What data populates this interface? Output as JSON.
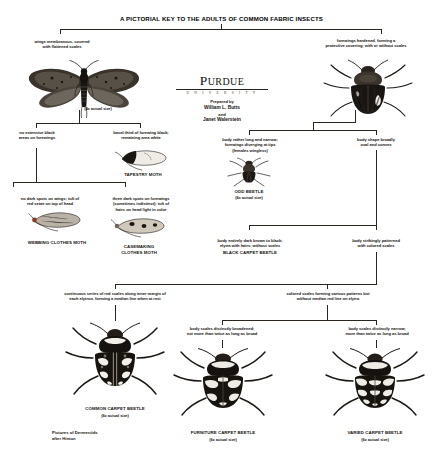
{
  "title": "A PICTORIAL KEY TO THE ADULTS OF COMMON FABRIC INSECTS",
  "publisher": {
    "name_main": "URDUE",
    "name_initial": "P",
    "subtitle": "U N I V E R S I T Y",
    "prepared_by_label": "Prepared by",
    "author_1": "William L. Butts",
    "conjunction": "and",
    "author_2": "Janet Walerstein"
  },
  "credit_note": "Pictures of Dermestids\nafter Hinton",
  "couplets": {
    "tier1_left": "wings membranous, covered\nwith flattened scales",
    "tier1_right": "forewings hardened, forming a\nprotective covering; with or without scales",
    "tier2_moth_left": "no extensive black\nareas on forewings",
    "tier2_moth_right": "basal third of forewing black;\nremaining area white",
    "tier2_beetle_left": "body rather long and narrow;\nforewings diverging at tips\n(females wingless)",
    "tier2_beetle_right": "body shape broadly\noval and convex",
    "tier3_moth_left": "no dark spots on wings; tuft of\nred setae on top of head",
    "tier3_moth_right": "three dark spots on forewings\n(sometimes indistinct); tuft of\nhairs on head light in color",
    "tier3_beetle_left": "body entirely dark brown to black;\nelytra with hairs; without scales",
    "tier3_beetle_right": "body strikingly patterned\nwith colored scales",
    "tier4_left": "continuous series of red scales along inner margin of\neach elytron, forming a median line when at rest",
    "tier4_right": "colored scales forming various patterns but\nwithout median red line on elytra",
    "tier5_left": "body scales distinctly broadened;\nnot more than twice as long as broad",
    "tier5_right": "body scales distinctly narrow;\nmore than twice as long as broad"
  },
  "species": {
    "clothes_moth_scale": "(4x actual size)",
    "tapestry_moth": "TAPESTRY MOTH",
    "webbing_clothes_moth": "WEBBING CLOTHES MOTH",
    "casemaking_clothes_moth": "CASEMAKING\nCLOTHES MOTH",
    "odd_beetle": "ODD BEETLE",
    "odd_beetle_scale": "(6x actual size)",
    "black_carpet_beetle": "BLACK CARPET BEETLE",
    "common_carpet_beetle": "COMMON CARPET BEETLE",
    "common_carpet_beetle_scale": "(6x actual size)",
    "furniture_carpet_beetle": "FURNITURE CARPET BEETLE",
    "furniture_carpet_beetle_scale": "(6x actual size)",
    "varied_carpet_beetle": "VARIED CARPET BEETLE",
    "varied_carpet_beetle_scale": "(6x actual size)"
  },
  "colors": {
    "ink": "#16130f",
    "line": "#2b2520",
    "paper": "#ffffff"
  }
}
